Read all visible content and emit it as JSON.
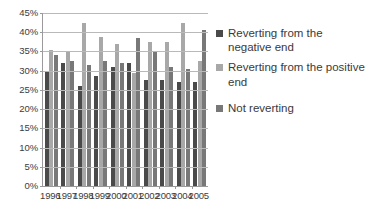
{
  "chart_data": {
    "type": "bar",
    "title": "",
    "subtitle": "",
    "xlabel": "",
    "ylabel": "",
    "categories": [
      "1996",
      "1997",
      "1998",
      "1999",
      "2000",
      "2001",
      "2002",
      "2003",
      "2004",
      "2005"
    ],
    "series": [
      {
        "name": "Reverting from the negative end",
        "color": "#4a4a4a",
        "values": [
          30.0,
          32.0,
          26.0,
          28.5,
          31.0,
          32.0,
          27.5,
          27.5,
          27.0,
          27.0
        ]
      },
      {
        "name": "Reverting from the positive end",
        "color": "#a8a8a8",
        "values": [
          35.5,
          34.8,
          42.3,
          38.8,
          37.0,
          29.5,
          37.5,
          37.5,
          42.5,
          32.5
        ]
      },
      {
        "name": "Not reverting",
        "color": "#787878",
        "values": [
          34.0,
          32.5,
          31.5,
          32.5,
          32.0,
          38.5,
          35.0,
          31.0,
          30.5,
          40.5
        ]
      }
    ],
    "ylim": [
      0,
      45
    ],
    "ytick_values": [
      0,
      5,
      10,
      15,
      20,
      25,
      30,
      35,
      40,
      45
    ],
    "ytick_labels": [
      "0%",
      "5%",
      "10%",
      "15%",
      "20%",
      "25%",
      "30%",
      "35%",
      "40%",
      "45%"
    ],
    "grid": true,
    "grid_axis": "y",
    "legend_position": "right",
    "legend": [
      "Reverting from the negative end",
      "Reverting from the positive end",
      "Not reverting"
    ]
  },
  "axes": {
    "axis_line_color": "#9a9a9a",
    "gridline_color": "#b9b9b9"
  },
  "canvas": {
    "background": "#ffffff"
  }
}
